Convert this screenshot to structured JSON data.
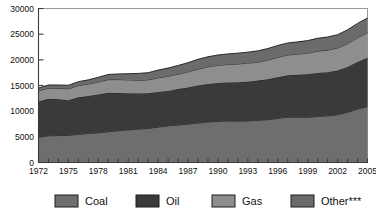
{
  "chart_data": {
    "type": "area",
    "stacked": true,
    "title": "",
    "subtitle": "",
    "xlabel": "",
    "ylabel": "",
    "grid": false,
    "legend_position": "bottom",
    "x": [
      1972,
      1973,
      1974,
      1975,
      1976,
      1977,
      1978,
      1979,
      1980,
      1981,
      1982,
      1983,
      1984,
      1985,
      1986,
      1987,
      1988,
      1989,
      1990,
      1991,
      1992,
      1993,
      1994,
      1995,
      1996,
      1997,
      1998,
      1999,
      2000,
      2001,
      2002,
      2003,
      2004,
      2005
    ],
    "xlim": [
      1972,
      2005
    ],
    "ylim": [
      0,
      30000
    ],
    "yticks": [
      0,
      5000,
      10000,
      15000,
      20000,
      25000,
      30000
    ],
    "ytick_labels": [
      "0",
      "5000",
      "10000",
      "15000",
      "20000",
      "25000",
      "30000"
    ],
    "xtick_labels": [
      "1972",
      "1975",
      "1978",
      "1981",
      "1984",
      "1987",
      "1990",
      "1993",
      "1996",
      "1999",
      "2002",
      "2005"
    ],
    "xticks_labeled": [
      1972,
      1975,
      1978,
      1981,
      1984,
      1987,
      1990,
      1993,
      1996,
      1999,
      2002,
      2005
    ],
    "series": [
      {
        "name": "Coal",
        "color": "#6e6e6e",
        "values": [
          5000,
          5200,
          5250,
          5300,
          5500,
          5650,
          5800,
          6000,
          6200,
          6350,
          6500,
          6650,
          6900,
          7150,
          7300,
          7500,
          7700,
          7900,
          8000,
          8100,
          8050,
          8100,
          8200,
          8350,
          8600,
          8850,
          8850,
          8800,
          9000,
          9100,
          9300,
          9800,
          10400,
          10900
        ]
      },
      {
        "name": "Oil",
        "color": "#3a3a3a",
        "values": [
          6900,
          7200,
          7050,
          6850,
          7200,
          7300,
          7450,
          7600,
          7350,
          7150,
          6950,
          6850,
          6850,
          6800,
          7000,
          7100,
          7300,
          7400,
          7500,
          7500,
          7600,
          7650,
          7750,
          7850,
          8000,
          8150,
          8250,
          8400,
          8450,
          8500,
          8600,
          8800,
          9200,
          9500
        ]
      },
      {
        "name": "Gas",
        "color": "#8e8e8e",
        "values": [
          2050,
          2100,
          2150,
          2200,
          2300,
          2350,
          2450,
          2550,
          2600,
          2600,
          2600,
          2600,
          2750,
          2850,
          2900,
          3050,
          3200,
          3350,
          3450,
          3500,
          3550,
          3600,
          3600,
          3750,
          3900,
          3950,
          4000,
          4100,
          4250,
          4300,
          4400,
          4550,
          4700,
          4850
        ]
      },
      {
        "name": "Other***",
        "color": "#6b6b6b",
        "values": [
          550,
          600,
          650,
          700,
          750,
          800,
          900,
          1000,
          1100,
          1200,
          1300,
          1400,
          1500,
          1600,
          1700,
          1800,
          1900,
          1950,
          2000,
          2050,
          2100,
          2150,
          2200,
          2250,
          2300,
          2350,
          2400,
          2450,
          2500,
          2550,
          2600,
          2700,
          2800,
          2900
        ]
      }
    ]
  },
  "legend": {
    "items": [
      {
        "label": "Coal",
        "color": "#6e6e6e"
      },
      {
        "label": "Oil",
        "color": "#3a3a3a"
      },
      {
        "label": "Gas",
        "color": "#8e8e8e"
      },
      {
        "label": "Other***",
        "color": "#6b6b6b"
      }
    ]
  },
  "colors": {
    "coal": "#6e6e6e",
    "oil": "#3a3a3a",
    "gas": "#8e8e8e",
    "other": "#6b6b6b",
    "axis": "#3b3b3b",
    "frame": "#9a9a9a",
    "text": "#111111",
    "background": "#ffffff"
  }
}
